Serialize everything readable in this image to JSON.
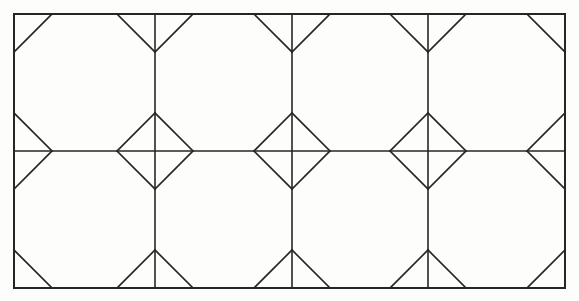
{
  "document": {
    "title": "Octagon and diamond tessellation",
    "kind": "line-drawing",
    "medium": "pencil on paper"
  },
  "canvas": {
    "width": 579,
    "height": 301,
    "background_color": "#fdfdfc"
  },
  "style": {
    "line_color": "#262626",
    "line_color_light": "#6b6b6b",
    "frame_stroke_width": 2.0,
    "grid_stroke_width": 1.6,
    "cut_stroke_width": 1.7
  },
  "geometry": {
    "frame": {
      "left": 14,
      "top": 14,
      "right": 565,
      "bottom": 288
    },
    "columns": 4,
    "rows": 2,
    "vertical_grid_x": [
      14,
      155,
      292,
      428,
      565
    ],
    "horizontal_grid_y": [
      14,
      151,
      288
    ],
    "corner_cut_inset": 38,
    "description": "Each rectangular cell has its four corners cut by 45-degree chords, forming an octagon. Where cells meet at interior grid vertices the four cuts form a complete diamond; at frame edges they form half-diamonds and V notches."
  },
  "cells": [
    {
      "id": "cell-r1c1",
      "row": 1,
      "col": 1,
      "shape": "octagon",
      "x0": 14,
      "y0": 14,
      "x1": 155,
      "y1": 151
    },
    {
      "id": "cell-r1c2",
      "row": 1,
      "col": 2,
      "shape": "octagon",
      "x0": 155,
      "y0": 14,
      "x1": 292,
      "y1": 151
    },
    {
      "id": "cell-r1c3",
      "row": 1,
      "col": 3,
      "shape": "octagon",
      "x0": 292,
      "y0": 14,
      "x1": 428,
      "y1": 151
    },
    {
      "id": "cell-r1c4",
      "row": 1,
      "col": 4,
      "shape": "octagon",
      "x0": 428,
      "y0": 14,
      "x1": 565,
      "y1": 151
    },
    {
      "id": "cell-r2c1",
      "row": 2,
      "col": 1,
      "shape": "octagon",
      "x0": 14,
      "y0": 151,
      "x1": 155,
      "y1": 288
    },
    {
      "id": "cell-r2c2",
      "row": 2,
      "col": 2,
      "shape": "octagon",
      "x0": 155,
      "y0": 151,
      "x1": 292,
      "y1": 288
    },
    {
      "id": "cell-r2c3",
      "row": 2,
      "col": 3,
      "shape": "octagon",
      "x0": 292,
      "y0": 151,
      "x1": 428,
      "y1": 288
    },
    {
      "id": "cell-r2c4",
      "row": 2,
      "col": 4,
      "shape": "octagon",
      "x0": 428,
      "y0": 151,
      "x1": 565,
      "y1": 288
    }
  ],
  "diamonds": [
    {
      "id": "diamond-interior-1",
      "cx": 155,
      "cy": 151,
      "radius": 37,
      "kind": "full"
    },
    {
      "id": "diamond-interior-2",
      "cx": 292,
      "cy": 151,
      "radius": 37,
      "kind": "full"
    },
    {
      "id": "diamond-interior-3",
      "cx": 428,
      "cy": 151,
      "radius": 37,
      "kind": "full"
    },
    {
      "id": "diamond-edge-left",
      "cx": 14,
      "cy": 151,
      "radius": 37,
      "kind": "half-right"
    },
    {
      "id": "diamond-edge-right",
      "cx": 565,
      "cy": 151,
      "radius": 37,
      "kind": "half-left"
    }
  ],
  "edge_notches": [
    {
      "id": "notch-top-1",
      "x": 155,
      "y": 14,
      "direction": "down",
      "depth": 38
    },
    {
      "id": "notch-top-2",
      "x": 292,
      "y": 14,
      "direction": "down",
      "depth": 38
    },
    {
      "id": "notch-top-3",
      "x": 428,
      "y": 14,
      "direction": "down",
      "depth": 38
    },
    {
      "id": "notch-bottom-1",
      "x": 155,
      "y": 288,
      "direction": "up",
      "depth": 38
    },
    {
      "id": "notch-bottom-2",
      "x": 292,
      "y": 288,
      "direction": "up",
      "depth": 38
    },
    {
      "id": "notch-bottom-3",
      "x": 428,
      "y": 288,
      "direction": "up",
      "depth": 38
    }
  ]
}
